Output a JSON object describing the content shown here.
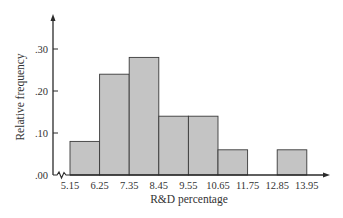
{
  "chart_data": {
    "type": "bar",
    "subtype": "histogram",
    "title": "",
    "xlabel": "R&D percentage",
    "ylabel": "Relative frequency",
    "bin_edges": [
      "5.15",
      "6.25",
      "7.35",
      "8.45",
      "9.55",
      "10.65",
      "11.75",
      "12.85",
      "13.95"
    ],
    "categories": [
      "5.15-6.25",
      "6.25-7.35",
      "7.35-8.45",
      "8.45-9.55",
      "9.55-10.65",
      "10.65-11.75",
      "11.75-12.85",
      "12.85-13.95"
    ],
    "values": [
      0.08,
      0.24,
      0.28,
      0.14,
      0.14,
      0.06,
      0.0,
      0.06
    ],
    "y_ticks": [
      ".00",
      ".10",
      ".20",
      ".30"
    ],
    "ylim": [
      0,
      0.36
    ],
    "grid": false,
    "legend": null,
    "axis_break": "x-axis zigzag near origin",
    "colors": {
      "bar_fill": "#c4c4c4",
      "bar_edge": "#3a3a3a",
      "axis": "#2a2a2a"
    }
  }
}
